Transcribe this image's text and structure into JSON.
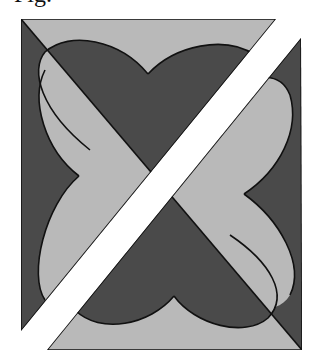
{
  "caption": {
    "text": "Fig. "
  },
  "figure": {
    "colors": {
      "dark": "#4a4a4a",
      "light": "#b9b9b9",
      "band": "#ffffff",
      "stroke": "#111111"
    },
    "hearts": [
      {
        "position": "top",
        "dip": [
          148,
          74
        ]
      },
      {
        "position": "left",
        "dip": [
          79,
          176
        ]
      },
      {
        "position": "right",
        "dip": [
          244,
          194
        ]
      },
      {
        "position": "bottom",
        "dip": [
          174,
          296
        ]
      }
    ]
  }
}
